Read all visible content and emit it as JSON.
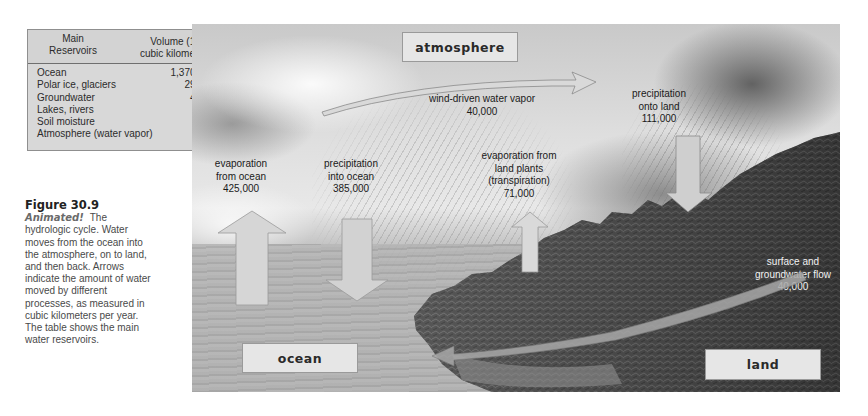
{
  "table": {
    "header": {
      "col1_line1": "Main",
      "col1_line2": "Reservoirs",
      "col2_line1": "Volume (10",
      "col2_sup": "3",
      "col2_line2": "cubic kilometers)"
    },
    "rows": [
      {
        "reservoir": "Ocean",
        "volume": "1,370,000"
      },
      {
        "reservoir": "Polar ice, glaciers",
        "volume": "29,000"
      },
      {
        "reservoir": "Groundwater",
        "volume": "4,000"
      },
      {
        "reservoir": "Lakes, rivers",
        "volume": "230"
      },
      {
        "reservoir": "Soil moisture",
        "volume": "67"
      },
      {
        "reservoir": "Atmosphere (water vapor)",
        "volume": "14"
      }
    ]
  },
  "caption": {
    "figure_number": "Figure 30.9",
    "animated": "Animated!",
    "text": "The hydrologic cycle. Water moves from the ocean into the atmosphere, on to land, and then back. Arrows indicate the amount of water moved by different processes, as measured in cubic kilometers per year. The table shows the main water reservoirs."
  },
  "diagram": {
    "boxes": {
      "atmosphere": "atmosphere",
      "ocean": "ocean",
      "land": "land"
    },
    "flows": {
      "wind": {
        "line1": "wind-driven water vapor",
        "value": "40,000"
      },
      "evap_ocean": {
        "line1": "evaporation",
        "line2": "from ocean",
        "value": "425,000"
      },
      "precip_ocean": {
        "line1": "precipitation",
        "line2": "into ocean",
        "value": "385,000"
      },
      "transpiration": {
        "line1": "evaporation from",
        "line2": "land plants",
        "line3": "(transpiration)",
        "value": "71,000"
      },
      "precip_land": {
        "line1": "precipitation",
        "line2": "onto land",
        "value": "111,000"
      },
      "surface_flow": {
        "line1": "surface and",
        "line2": "groundwater flow",
        "value": "40,000"
      }
    }
  },
  "colors": {
    "box_fill": "#e6e6e6",
    "arrow_fill": "#d9d9d9",
    "table_fill": "#d8d8d8"
  }
}
